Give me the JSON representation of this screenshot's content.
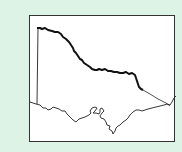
{
  "map": {
    "subject": "Victoria (Australia) state outline",
    "colors": {
      "background": "#dcf3e6",
      "frame_fill": "#ffffff",
      "frame_border": "#333333",
      "border_thick": "#111111",
      "border_thin": "#222222"
    },
    "features": [
      {
        "name": "northern-border-murray-river",
        "style": "thick"
      },
      {
        "name": "western-border-sa",
        "style": "thin"
      },
      {
        "name": "eastern-border-nsw",
        "style": "thin"
      },
      {
        "name": "southern-coastline",
        "style": "thin"
      }
    ]
  }
}
